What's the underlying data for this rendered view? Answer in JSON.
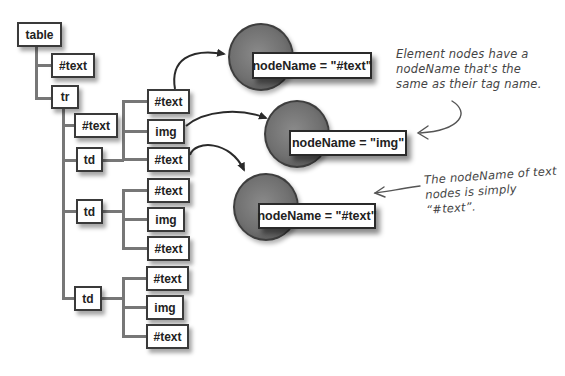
{
  "tree": {
    "root": "table",
    "root_children": [
      "#text",
      "tr"
    ],
    "tr_children": [
      "#text",
      "td",
      "td",
      "td"
    ],
    "td_groups": [
      [
        "#text",
        "img",
        "#text"
      ],
      [
        "#text",
        "img",
        "#text"
      ],
      [
        "#text",
        "img",
        "#text"
      ]
    ]
  },
  "callouts": [
    {
      "label": "nodeName = \"#text\"",
      "points_from": "td[0] > #text (first)"
    },
    {
      "label": "nodeName = \"img\"",
      "points_from": "td[0] > img"
    },
    {
      "label": "nodeName = \"#text\"",
      "points_from": "td[0] > #text (last)"
    }
  ],
  "notes": {
    "element_nodes": "Element nodes have a nodeName that's the same as their tag name.",
    "element_nodes_lines": [
      "Element nodes have a",
      "nodeName that's the",
      "same as their tag name."
    ],
    "text_nodes": "The nodeName of text nodes is simply \"#text\".",
    "text_nodes_lines": [
      "The nodeName of text",
      "nodes is simply “#text”."
    ]
  },
  "colors": {
    "line": "#777777",
    "border": "#3a3a3a",
    "circle": "#707070",
    "background": "#ffffff"
  }
}
